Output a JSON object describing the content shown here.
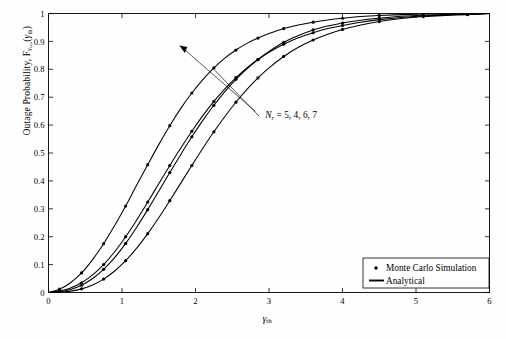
{
  "figure": {
    "background_color": "#fefefe",
    "axis_color": "#000000",
    "curve_color": "#000000"
  },
  "axis_labels": {
    "y_prefix": "Outage Probability, F",
    "y_sub_main": "γ",
    "y_sub_sub": "sco",
    "y_arg_open": "(",
    "y_arg": "γ",
    "y_arg_sub": "th",
    "y_arg_close": ")",
    "x_main": "γ",
    "x_sub": "th"
  },
  "annotation": {
    "symbol": "N",
    "symbol_sub": "r",
    "equals_values": "= 5, 4, 6, 7",
    "full_text": "N_r = 5, 4, 6, 7",
    "x_data": 2.95,
    "y_data": 0.635,
    "arrow_tip_x": 1.78,
    "arrow_tip_y": 0.885
  },
  "legend": {
    "entries": [
      {
        "label": "Monte Carlo Simulation",
        "marker": "dot"
      },
      {
        "label": "Analytical",
        "marker": "line"
      }
    ],
    "box_x": 363,
    "box_y": 258,
    "box_w": 126,
    "box_h": 30
  },
  "chart_data": {
    "type": "line",
    "title": "",
    "subtitle": "",
    "xlabel": "γth",
    "ylabel": "Outage Probability, Fγsco(γth)",
    "xlim": [
      0,
      6
    ],
    "ylim": [
      0,
      1
    ],
    "xticks": [
      0,
      1,
      2,
      3,
      4,
      5,
      6
    ],
    "xticklabels": [
      "0",
      "1",
      "2",
      "3",
      "4",
      "5",
      "6"
    ],
    "yticks": [
      0,
      0.1,
      0.2,
      0.3,
      0.4,
      0.5,
      0.6,
      0.7,
      0.8,
      0.9,
      1
    ],
    "yticklabels": [
      "0",
      "0.1",
      "0.2",
      "0.3",
      "0.4",
      "0.5",
      "0.6",
      "0.7",
      "0.8",
      "0.9",
      "1"
    ],
    "grid": false,
    "legend_position": "lower right",
    "annotations": [
      "N_r = 5, 4, 6, 7"
    ],
    "series": [
      {
        "name": "N_r = 5",
        "style": "analytical-with-markers",
        "x": [
          0.0,
          0.15,
          0.3,
          0.45,
          0.6,
          0.75,
          0.9,
          1.05,
          1.2,
          1.35,
          1.5,
          1.65,
          1.8,
          1.95,
          2.1,
          2.25,
          2.4,
          2.55,
          2.7,
          2.85,
          3.0,
          3.2,
          3.4,
          3.6,
          3.8,
          4.0,
          4.25,
          4.5,
          4.8,
          5.1,
          5.4,
          5.7,
          6.0
        ],
        "y": [
          0.0,
          0.012,
          0.035,
          0.07,
          0.118,
          0.175,
          0.24,
          0.31,
          0.385,
          0.458,
          0.53,
          0.598,
          0.66,
          0.715,
          0.763,
          0.805,
          0.84,
          0.869,
          0.893,
          0.912,
          0.928,
          0.946,
          0.959,
          0.969,
          0.977,
          0.983,
          0.989,
          0.993,
          0.996,
          0.998,
          0.999,
          0.999,
          1.0
        ]
      },
      {
        "name": "N_r = 4",
        "style": "analytical-with-markers",
        "x": [
          0.0,
          0.15,
          0.3,
          0.45,
          0.6,
          0.75,
          0.9,
          1.05,
          1.2,
          1.35,
          1.5,
          1.65,
          1.8,
          1.95,
          2.1,
          2.25,
          2.4,
          2.55,
          2.7,
          2.85,
          3.0,
          3.2,
          3.4,
          3.6,
          3.8,
          4.0,
          4.25,
          4.5,
          4.8,
          5.1,
          5.4,
          5.7,
          6.0
        ],
        "y": [
          0.0,
          0.005,
          0.016,
          0.035,
          0.063,
          0.1,
          0.146,
          0.2,
          0.26,
          0.324,
          0.39,
          0.455,
          0.518,
          0.578,
          0.634,
          0.685,
          0.73,
          0.77,
          0.805,
          0.835,
          0.861,
          0.89,
          0.913,
          0.931,
          0.946,
          0.957,
          0.969,
          0.978,
          0.986,
          0.991,
          0.995,
          0.997,
          1.0
        ]
      },
      {
        "name": "N_r = 6",
        "style": "analytical-with-markers",
        "x": [
          0.0,
          0.15,
          0.3,
          0.45,
          0.6,
          0.75,
          0.9,
          1.05,
          1.2,
          1.35,
          1.5,
          1.65,
          1.8,
          1.95,
          2.1,
          2.25,
          2.4,
          2.55,
          2.7,
          2.85,
          3.0,
          3.2,
          3.4,
          3.6,
          3.8,
          4.0,
          4.25,
          4.5,
          4.8,
          5.1,
          5.4,
          5.7,
          6.0
        ],
        "y": [
          0.0,
          0.003,
          0.011,
          0.026,
          0.05,
          0.083,
          0.125,
          0.176,
          0.234,
          0.297,
          0.363,
          0.43,
          0.495,
          0.558,
          0.617,
          0.671,
          0.72,
          0.764,
          0.802,
          0.835,
          0.864,
          0.897,
          0.921,
          0.941,
          0.955,
          0.966,
          0.976,
          0.983,
          0.99,
          0.994,
          0.996,
          0.998,
          1.0
        ]
      },
      {
        "name": "N_r = 7",
        "style": "analytical-with-markers",
        "x": [
          0.0,
          0.15,
          0.3,
          0.45,
          0.6,
          0.75,
          0.9,
          1.05,
          1.2,
          1.35,
          1.5,
          1.65,
          1.8,
          1.95,
          2.1,
          2.25,
          2.4,
          2.55,
          2.7,
          2.85,
          3.0,
          3.2,
          3.4,
          3.6,
          3.8,
          4.0,
          4.25,
          4.5,
          4.8,
          5.1,
          5.4,
          5.7,
          6.0
        ],
        "y": [
          0.0,
          0.001,
          0.005,
          0.013,
          0.027,
          0.048,
          0.077,
          0.114,
          0.159,
          0.211,
          0.268,
          0.329,
          0.392,
          0.455,
          0.517,
          0.576,
          0.631,
          0.682,
          0.728,
          0.769,
          0.805,
          0.846,
          0.879,
          0.905,
          0.926,
          0.943,
          0.959,
          0.971,
          0.982,
          0.989,
          0.993,
          0.996,
          1.0
        ]
      }
    ],
    "marker_x": [
      0.15,
      0.45,
      0.75,
      1.05,
      1.35,
      1.65,
      1.95,
      2.25,
      2.55,
      2.85,
      3.2,
      3.6,
      4.0,
      4.5,
      5.1,
      5.7
    ]
  }
}
